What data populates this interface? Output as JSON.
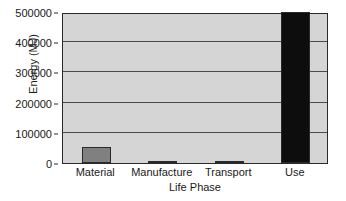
{
  "chart_data": {
    "type": "bar",
    "title": "",
    "xlabel": "Life Phase",
    "ylabel": "Energy (MJ)",
    "categories": [
      "Material",
      "Manufacture",
      "Transport",
      "Use"
    ],
    "values": [
      53000,
      5000,
      5000,
      500000
    ],
    "ylim": [
      0,
      500000
    ],
    "yticks": [
      0,
      100000,
      200000,
      300000,
      400000,
      500000
    ],
    "ytick_labels": [
      "0",
      "100000",
      "200000",
      "300000",
      "400000",
      "500000"
    ],
    "grid": true,
    "legend": false,
    "bar_colors": [
      "#808080",
      "#808080",
      "#808080",
      "#0d0d0d"
    ],
    "plot_background": "#d5d5d5",
    "gridline_color": "#4a4a4a",
    "axis_color": "#2a2a2a",
    "text_color": "#1a1a1a",
    "page_background": "#ffffff"
  }
}
